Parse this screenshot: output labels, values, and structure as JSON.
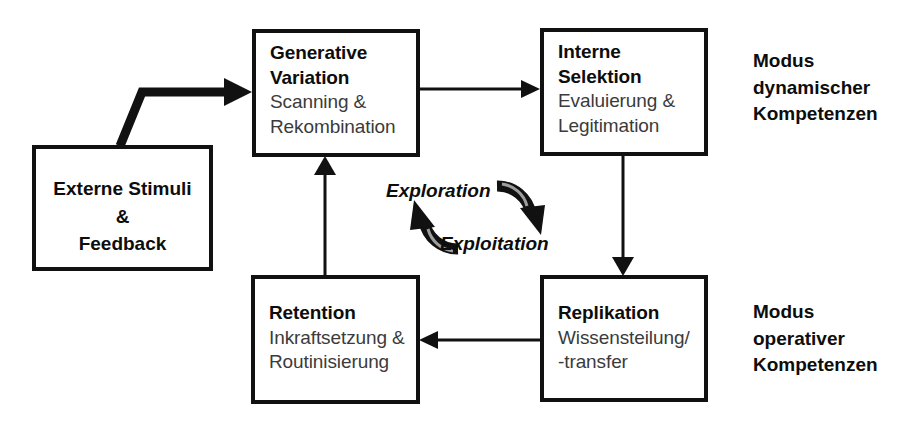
{
  "diagram": {
    "nodes": {
      "generative_variation": {
        "title_line1": "Generative",
        "title_line2": "Variation",
        "sub_line1": "Scanning &",
        "sub_line2": "Rekombination"
      },
      "interne_selektion": {
        "title_line1": "Interne",
        "title_line2": "Selektion",
        "sub_line1": "Evaluierung &",
        "sub_line2": "Legitimation"
      },
      "externe_stimuli": {
        "line1": "Externe Stimuli",
        "line2": "&",
        "line3": "Feedback"
      },
      "retention": {
        "title_line1": "Retention",
        "sub_line1": "Inkraftsetzung &",
        "sub_line2": "Routinisierung"
      },
      "replikation": {
        "title_line1": "Replikation",
        "sub_line1": "Wissensteilung/",
        "sub_line2": "-transfer"
      }
    },
    "cycle": {
      "exploration": "Exploration",
      "exploitation": "Exploitation"
    },
    "side_labels": {
      "dynamic": {
        "line1": "Modus",
        "line2": "dynamischer",
        "line3": "Kompetenzen"
      },
      "operative": {
        "line1": "Modus",
        "line2": "operativer",
        "line3": "Kompetenzen"
      }
    },
    "colors": {
      "stroke": "#111111",
      "title_text": "#0d0d0d",
      "sub_text": "#3b3b3b",
      "background": "#ffffff"
    }
  }
}
